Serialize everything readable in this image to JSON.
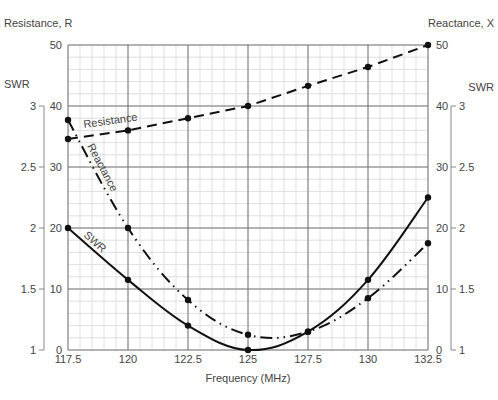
{
  "chart_data": {
    "type": "line",
    "title": "",
    "xlabel": "Frequency (MHz)",
    "left_axis_label": "Resistance, R",
    "right_axis_label": "Reactance, X",
    "swr_axis_label": "SWR",
    "x": [
      117.5,
      120,
      122.5,
      125,
      127.5,
      130,
      132.5
    ],
    "x_tick_labels": [
      "117.5",
      "120",
      "122.5",
      "125",
      "127.5",
      "130",
      "132.5"
    ],
    "y_ticks": [
      0,
      10,
      20,
      30,
      40,
      50
    ],
    "y_tick_labels": [
      "0",
      "10",
      "20",
      "30",
      "40",
      "50"
    ],
    "swr_ticks": [
      1,
      1.5,
      2,
      2.5,
      3
    ],
    "swr_tick_labels": [
      "1",
      "1.5",
      "2",
      "2.5",
      "3"
    ],
    "ylim": [
      0,
      50
    ],
    "swr_lim": [
      1,
      3.5
    ],
    "xlim": [
      117.5,
      132.5
    ],
    "grid": true,
    "series": [
      {
        "name": "Resistance",
        "axis": "R",
        "style": "dashed",
        "values": [
          34.6,
          36,
          38,
          40,
          43.3,
          46.4,
          50
        ]
      },
      {
        "name": "Reactance",
        "axis": "X",
        "style": "dash-dot-dot",
        "values": [
          37.7,
          20,
          8.2,
          2.5,
          3,
          8.5,
          17.5
        ]
      },
      {
        "name": "SWR",
        "axis": "SWR",
        "style": "solid",
        "values": [
          2.0,
          1.575,
          1.2,
          1.0,
          1.15,
          1.575,
          2.25
        ]
      }
    ],
    "annotations": [
      "Resistance",
      "Reactance",
      "SWR"
    ]
  }
}
